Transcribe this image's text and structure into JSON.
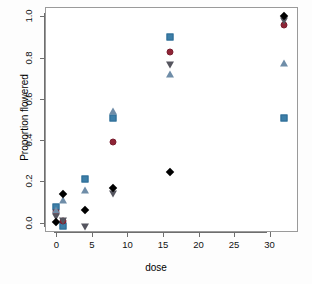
{
  "chart_data": {
    "type": "scatter",
    "title": "",
    "xlabel": "dose",
    "ylabel": "Proportion flowered",
    "xlim": [
      -1.6,
      34.0
    ],
    "ylim": [
      -0.045,
      1.045
    ],
    "grid": false,
    "legend": "none",
    "xticks": [
      0,
      5,
      10,
      15,
      20,
      25,
      30
    ],
    "xtick_labels": [
      "0",
      "5",
      "10",
      "15",
      "20",
      "25",
      "30"
    ],
    "yticks": [
      0.0,
      0.2,
      0.4,
      0.6,
      0.8,
      1.0
    ],
    "ytick_labels": [
      "0.0",
      "0.2",
      "0.4",
      "0.6",
      "0.8",
      "1.0"
    ],
    "x": [
      0,
      1,
      4,
      8,
      16,
      32
    ],
    "series": [
      {
        "name": "series-square",
        "marker": "square",
        "color": "#2f6d96",
        "fill": "#3d7fa8",
        "values": [
          0.075,
          -0.018,
          0.21,
          0.505,
          0.9,
          0.505
        ]
      },
      {
        "name": "series-circle",
        "marker": "circle",
        "color": "#7a2030",
        "fill": "#8f2436",
        "values": [
          0.052,
          0.008,
          null,
          0.39,
          0.828,
          0.96
        ]
      },
      {
        "name": "series-triangle-up",
        "marker": "triangle-up",
        "color": "#5f7f9c",
        "fill": "#6f8da8",
        "values": [
          0.06,
          0.112,
          0.16,
          0.54,
          0.72,
          0.775
        ]
      },
      {
        "name": "series-triangle-down",
        "marker": "triangle-down",
        "color": "#4a4a5a",
        "fill": "#55555f",
        "values": [
          0.03,
          0.01,
          -0.02,
          0.14,
          0.765,
          0.975
        ]
      },
      {
        "name": "series-diamond",
        "marker": "diamond",
        "color": "#000000",
        "fill": "#000000",
        "values": [
          0.005,
          0.138,
          0.062,
          0.17,
          0.248,
          1.0
        ]
      }
    ]
  }
}
